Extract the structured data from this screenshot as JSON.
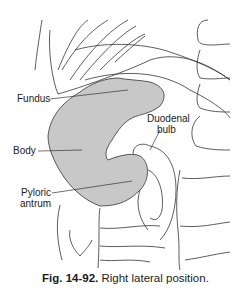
{
  "figure": {
    "labels": {
      "fundus": "Fundus",
      "duodenal_bulb_line1": "Duodenal",
      "duodenal_bulb_line2": "bulb",
      "body": "Body",
      "pyloric_line1": "Pyloric",
      "pyloric_line2": "antrum"
    },
    "caption": {
      "number": "Fig. 14-92.",
      "text": "Right lateral position."
    },
    "colors": {
      "stomach_fill": "#c8c8c8",
      "line": "#333333"
    }
  }
}
